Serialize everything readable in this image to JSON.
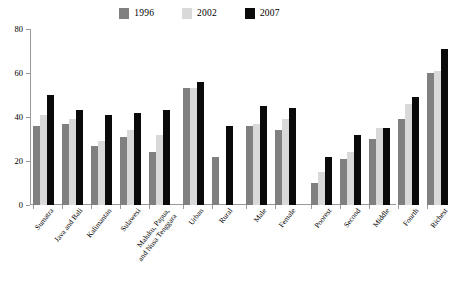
{
  "chart_data": {
    "type": "bar",
    "title": "",
    "subtitle": "",
    "xlabel": "",
    "ylabel": "",
    "ylim": [
      0,
      80
    ],
    "yticks": [
      0,
      20,
      40,
      60,
      80
    ],
    "grid": false,
    "legend_position": "top-center",
    "legend": [
      "1996",
      "2002",
      "2007"
    ],
    "series": [
      {
        "name": "1996",
        "color": "#808080",
        "values": [
          36,
          37,
          27,
          31,
          24,
          53,
          22,
          36,
          34,
          10,
          21,
          30,
          39,
          60
        ]
      },
      {
        "name": "2002",
        "color": "#d9d9d9",
        "values": [
          41,
          39,
          29,
          34,
          32,
          53,
          null,
          37,
          39,
          15,
          24,
          35,
          46,
          61
        ]
      },
      {
        "name": "2007",
        "color": "#0a0a0a",
        "values": [
          50,
          43,
          41,
          42,
          43,
          56,
          36,
          45,
          44,
          22,
          32,
          35,
          49,
          71
        ]
      }
    ],
    "categories": [
      "Sumatra",
      "Java and Bali",
      "Kalimantan",
      "Sulawesi",
      "Maluku, Papua,\nand Nusa Tenggara",
      "Urban",
      "Rural",
      "Male",
      "Female",
      "Poorest",
      "Second",
      "Middle",
      "Fourth",
      "Richest"
    ],
    "groups": [
      {
        "name": "region",
        "categories": [
          {
            "label": "Sumatra",
            "v1996": 36,
            "v2002": 41,
            "v2007": 50
          },
          {
            "label": "Java and Bali",
            "v1996": 37,
            "v2002": 39,
            "v2007": 43
          },
          {
            "label": "Kalimantan",
            "v1996": 27,
            "v2002": 29,
            "v2007": 41
          },
          {
            "label": "Sulawesi",
            "v1996": 31,
            "v2002": 34,
            "v2007": 42
          },
          {
            "label": "Maluku, Papua,\nand Nusa Tenggara",
            "v1996": 24,
            "v2002": 32,
            "v2007": 43
          }
        ]
      },
      {
        "name": "residence",
        "categories": [
          {
            "label": "Urban",
            "v1996": 53,
            "v2002": 53,
            "v2007": 56
          },
          {
            "label": "Rural",
            "v1996": 22,
            "v2002": null,
            "v2007": 36
          }
        ]
      },
      {
        "name": "sex",
        "categories": [
          {
            "label": "Male",
            "v1996": 36,
            "v2002": 37,
            "v2007": 45
          },
          {
            "label": "Female",
            "v1996": 34,
            "v2002": 39,
            "v2007": 44
          }
        ]
      },
      {
        "name": "wealth-quintile",
        "categories": [
          {
            "label": "Poorest",
            "v1996": 10,
            "v2002": 15,
            "v2007": 22
          },
          {
            "label": "Second",
            "v1996": 21,
            "v2002": 24,
            "v2007": 32
          },
          {
            "label": "Middle",
            "v1996": 30,
            "v2002": 35,
            "v2007": 35
          },
          {
            "label": "Fourth",
            "v1996": 39,
            "v2002": 46,
            "v2007": 49
          },
          {
            "label": "Richest",
            "v1996": 60,
            "v2002": 61,
            "v2007": 71
          }
        ]
      }
    ]
  },
  "colors": {
    "series_1996": "#808080",
    "series_2002": "#d9d9d9",
    "series_2007": "#0a0a0a",
    "axis": "#9a9a9a",
    "background": "#ffffff"
  }
}
